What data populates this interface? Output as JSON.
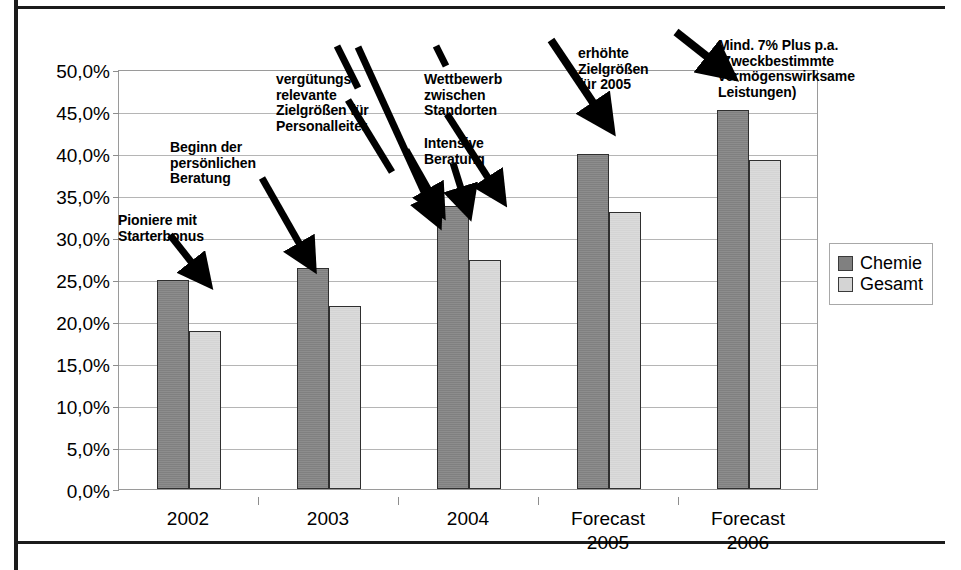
{
  "chart_data": {
    "type": "bar",
    "title": "",
    "subtitle": "",
    "xlabel": "",
    "ylabel": "",
    "categories": [
      "2002",
      "2003",
      "2004",
      "Forecast\n2005",
      "Forecast\n2006"
    ],
    "series": [
      {
        "name": "Chemie",
        "color": "#808080",
        "values": [
          25.0,
          26.4,
          33.9,
          40.1,
          45.3
        ]
      },
      {
        "name": "Gesamt",
        "color": "#d4d4d4",
        "values": [
          18.9,
          21.9,
          27.4,
          33.1,
          39.3
        ]
      }
    ],
    "ylim": [
      0,
      50
    ],
    "ytick_step": 5,
    "ytick_labels": [
      "0,0%",
      "5,0%",
      "10,0%",
      "15,0%",
      "20,0%",
      "25,0%",
      "30,0%",
      "35,0%",
      "40,0%",
      "45,0%",
      "50,0%"
    ],
    "value_format": "percent_comma",
    "grid": true,
    "legend_position": "right",
    "annotations": [
      {
        "id": "pioniere",
        "text": "Pioniere mit\nStarterbonus"
      },
      {
        "id": "beginn-beratung",
        "text": "Beginn der\npersönlichen\nBeratung"
      },
      {
        "id": "verguetungsrelevante",
        "text": "vergütungs-\nrelevante\nZielgrößen für\nPersonalleiter"
      },
      {
        "id": "wettbewerb",
        "text": "Wettbewerb\nzwischen\nStandorten"
      },
      {
        "id": "intensive-beratung",
        "text": "Intensive\nBeratung"
      },
      {
        "id": "erhoehte-zielgroessen",
        "text": "erhöhte\nZielgrößen\nfür 2005"
      },
      {
        "id": "mind-7-prozent",
        "text": "Mind. 7% Plus p.a.\n(Zweckbestimmte\nvermögenswirksame\nLeistungen)"
      }
    ]
  },
  "legend": {
    "items": [
      {
        "label": "Chemie",
        "color": "#808080"
      },
      {
        "label": "Gesamt",
        "color": "#d4d4d4"
      }
    ]
  },
  "axis": {
    "y_labels": [
      "50,0%",
      "45,0%",
      "40,0%",
      "35,0%",
      "30,0%",
      "25,0%",
      "20,0%",
      "15,0%",
      "10,0%",
      "5,0%",
      "0,0%"
    ],
    "x_labels": [
      "2002",
      "2003",
      "2004",
      "Forecast\n2005",
      "Forecast\n2006"
    ]
  },
  "annotations": {
    "pioniere": "Pioniere mit\nStarterbonus",
    "beginn_beratung": "Beginn der\npersönlichen\nBeratung",
    "verguetung": "vergütungs-\nrelevante\nZielgrößen für\nPersonalleiter",
    "wettbewerb": "Wettbewerb\nzwischen\nStandorten",
    "intensive_beratung": "Intensive\nBeratung",
    "erhoehte_zielgroessen": "erhöhte\nZielgrößen\nfür 2005",
    "mind_sieben_prozent": "Mind. 7% Plus p.a.\n(Zweckbestimmte\nvermögenswirksame\nLeistungen)"
  },
  "colors": {
    "chemie": "#808080",
    "gesamt": "#d4d4d4",
    "gridline": "#b5b5b5",
    "frame": "#1b1b1b"
  }
}
